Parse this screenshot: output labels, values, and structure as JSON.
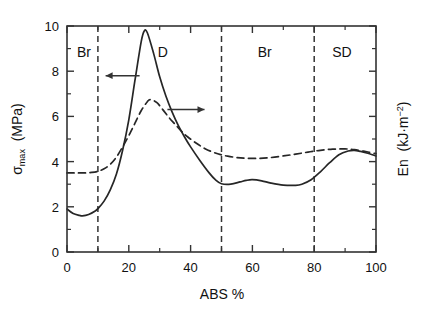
{
  "chart_data": {
    "type": "line",
    "title": "",
    "xlabel": "ABS %",
    "ylabel_left": "σmax (MPa)",
    "ylabel_right": "En (kJ·m−2)",
    "xlim": [
      0,
      100
    ],
    "ylim_left": [
      0,
      10
    ],
    "ylim_right": [
      0,
      10
    ],
    "grid": false,
    "legend": "none",
    "x_ticks": [
      0,
      20,
      40,
      60,
      80,
      100
    ],
    "x_ticklabels": [
      "0",
      "20",
      "40",
      "60",
      "80",
      "100"
    ],
    "x_minor_ticks": [
      10,
      30,
      50,
      70,
      90
    ],
    "y_ticks_left": [
      0,
      2,
      4,
      6,
      8,
      10
    ],
    "y_ticklabels_left": [
      "0",
      "2",
      "4",
      "6",
      "8",
      "10"
    ],
    "y_minor_ticks_left": [
      1,
      3,
      5,
      7,
      9
    ],
    "y_ticks_right": [
      0,
      2,
      4,
      6,
      8,
      10
    ],
    "y_ticklabels_right": [
      "",
      "",
      "",
      "",
      "",
      ""
    ],
    "region_dividers": [
      10,
      50,
      80
    ],
    "regions": [
      {
        "label": "Br",
        "x_center": 5.5,
        "y": 8.85
      },
      {
        "label": "D",
        "x_center": 31,
        "y": 8.85
      },
      {
        "label": "Br",
        "x_center": 64,
        "y": 8.85
      },
      {
        "label": "SD",
        "x_center": 89,
        "y": 8.85
      }
    ],
    "annotations": [
      {
        "name": "arrow-to-left-axis",
        "direction": "left",
        "x_from": 23.5,
        "x_to": 12.5,
        "y": 7.8
      },
      {
        "name": "arrow-to-right-axis",
        "direction": "right",
        "x_from": 32.5,
        "x_to": 44.5,
        "y": 6.3
      }
    ],
    "series": [
      {
        "name": "sigma_max",
        "style": "solid",
        "axis": "left",
        "color": "#262626",
        "x": [
          0,
          2,
          4,
          5,
          7,
          9,
          10,
          12,
          14,
          16,
          18,
          20,
          22,
          24,
          25,
          26,
          28,
          30,
          32,
          34,
          36,
          38,
          40,
          43,
          46,
          48,
          50,
          53,
          56,
          58,
          60,
          63,
          66,
          70,
          74,
          76,
          79,
          82,
          85,
          88,
          91,
          93,
          95,
          97,
          100
        ],
        "y": [
          1.9,
          1.7,
          1.62,
          1.6,
          1.66,
          1.8,
          1.92,
          2.25,
          2.75,
          3.45,
          4.5,
          5.85,
          7.6,
          9.3,
          9.78,
          9.7,
          8.8,
          7.75,
          6.9,
          6.2,
          5.6,
          5.1,
          4.65,
          4.05,
          3.5,
          3.2,
          3.02,
          3.0,
          3.1,
          3.17,
          3.2,
          3.15,
          3.05,
          2.96,
          2.95,
          3.0,
          3.2,
          3.55,
          3.95,
          4.3,
          4.47,
          4.5,
          4.45,
          4.38,
          4.25
        ]
      },
      {
        "name": "En",
        "style": "dashed",
        "axis": "right",
        "color": "#262626",
        "x": [
          0,
          3,
          6,
          8,
          10,
          12,
          14,
          16,
          18,
          20,
          22,
          24,
          26,
          27,
          29,
          31,
          33,
          35,
          37,
          39,
          42,
          45,
          48,
          50,
          52,
          55,
          58,
          62,
          66,
          70,
          74,
          78,
          82,
          86,
          90,
          93,
          96,
          100
        ],
        "y": [
          3.5,
          3.5,
          3.5,
          3.52,
          3.57,
          3.68,
          3.88,
          4.2,
          4.65,
          5.15,
          5.7,
          6.25,
          6.65,
          6.74,
          6.62,
          6.3,
          5.95,
          5.65,
          5.35,
          5.1,
          4.8,
          4.55,
          4.38,
          4.3,
          4.24,
          4.18,
          4.15,
          4.14,
          4.18,
          4.25,
          4.33,
          4.42,
          4.5,
          4.55,
          4.56,
          4.53,
          4.46,
          4.35
        ]
      }
    ]
  },
  "figure": {
    "background": "#ffffff",
    "frame_color": "#333333",
    "divider_style": "dashed"
  }
}
